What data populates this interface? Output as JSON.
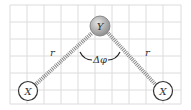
{
  "diagram": {
    "central_atom": {
      "label": "Y",
      "x": 100,
      "y": 26
    },
    "left_atom": {
      "label": "X",
      "x": 28,
      "y": 91
    },
    "right_atom": {
      "label": "X",
      "x": 163,
      "y": 91
    },
    "bond_left_label": "r",
    "bond_right_label": "r",
    "angle_label": "Δφ",
    "colors": {
      "grid": "#d9d9d9",
      "bond": "#8a8a8a",
      "atom_y": "#a8a8a8",
      "atom_x_stroke": "#333333"
    }
  }
}
